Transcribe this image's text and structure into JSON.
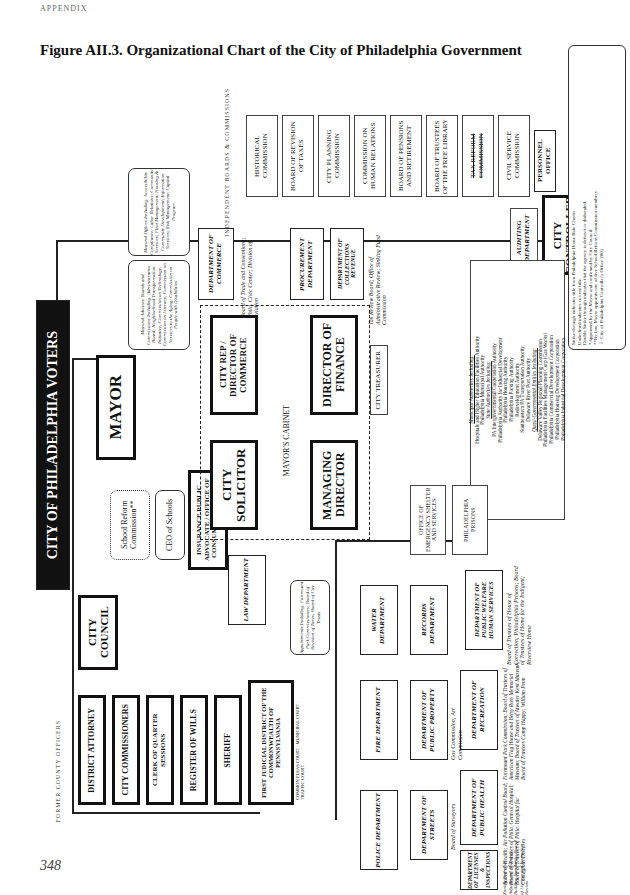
{
  "page": {
    "header": "APPENDIX",
    "title": "Figure AII.3.  Organizational Chart of the City of Philadelphia Government",
    "page_number": "348"
  },
  "chart": {
    "voters": "CITY OF PHILADELPHIA VOTERS",
    "mayor": "MAYOR",
    "city_council": "CITY COUNCIL",
    "city_controller": "CITY CONTROLLER",
    "auditing_department": "AUDITING DEPARTMENT",
    "school_reform": "School Reform Commission**",
    "ceo_schools": "CEO of Schools",
    "insurance_advocate": "INSURANCE PUBLIC ADVOCATE / OFFICE OF CONSUMER AFFAIRS*",
    "mayoral_advisory": "Mayoral Advisory Boards and Commissions Including: Administrative Board; Neighborhood Transformation Initiative; Commission on Technology; Commission on Literacy; Commission on Services to the Aging; Commission on People with Disabilities",
    "mayoral_offices": "Mayoral Offices Including: Accessibility Compliance; Labor Relations; Community Services; Fleet Management; Housing & Community Development; Information Services; Risk Management; Capital Program",
    "cabinet_label": "MAYOR'S CABINET",
    "city_solicitor": "CITY SOLICITOR",
    "city_rep": "CITY REP / DIRECTOR OF COMMERCE",
    "managing_director": "MANAGING DIRECTOR",
    "director_finance": "DIRECTOR OF FINANCE",
    "law_department": "LAW DEPARTMENT",
    "dept_commerce": "DEPARTMENT OF COMMERCE",
    "commerce_boards": "Board of Trade and Conventions; Phila. Civic Center; Division of Aviation",
    "procurement": "PROCUREMENT DEPARTMENT",
    "dept_revenue": "DEPARTMENT OF COLLECTIONS REVENUE",
    "finance_boards": "Tax Review Board; Office of Administrative Review; Sinking Fund Commission",
    "city_treasurer": "CITY TREASURER",
    "appointments": "Appointments Including: Fairmount Park Commissioners; Board of Revision of Taxes; Board of City Trusts",
    "independent_label": "INDEPENDENT BOARDS & COMMISSIONS",
    "independent_boards": [
      "HISTORICAL COMMISSION",
      "BOARD OF REVISION OF TAXES",
      "CITY PLANNING COMMISSION",
      "COMMISSION ON HUMAN RELATIONS",
      "BOARD OF PENSIONS AND RETIREMENT",
      "BOARD OF TRUSTEES OF THE FREE LIBRARY",
      "TAX REFORM COMMISSION",
      "CIVIL SERVICE COMMISSION",
      "PERSONNEL OFFICE"
    ],
    "authorities": {
      "municipal_heading": "Municipal Authorities Including:",
      "municipal": [
        "Hospitals and Higher Education Facilities Authority",
        "Philadelphia Municipal Authority"
      ],
      "state_heading": "State Authorities Including:",
      "state": [
        "PA Intergovernmental Cooperation Authority",
        "Philadelphia Authority for Industrial Development",
        "Philadelphia Housing Authority",
        "Philadelphia Parking Authority",
        "Redevelopment Authority",
        "Southeastern PA Transportation Authority",
        "Delaware River Port Authority"
      ],
      "quasi_heading": "Quasi-Governmental Entities Including:",
      "quasi": [
        "Delaware Valley Regional Planning Commission",
        "Philadelphia Facilities Management Corp (Gas Works)",
        "Philadelphia Commercial Development Corporation",
        "Philadelphia Housing Development Corporation",
        "Philadelphia Industrial Development Corporation"
      ]
    },
    "md_departments": [
      "OFFICE OF EMERGENCY SHELTER AND SERVICES",
      "PHILADELPHIA PRISONS",
      "DEPARTMENT OF PUBLIC WELFARE HUMAN SERVICES",
      "WATER DEPARTMENT",
      "RECORDS DEPARTMENT",
      "DEPARTMENT OF RECREATION",
      "FIRE DEPARTMENT",
      "DEPARTMENT OF PUBLIC PROPERTY",
      "DEPARTMENT OF PUBLIC HEALTH",
      "POLICE DEPARTMENT",
      "DEPARTMENT OF STREETS",
      "DEPARTMENT OF LICENSES & INSPECTIONS"
    ],
    "md_notes": {
      "human_services": "Board of Trustees of House of Correction; Philadelphia Prisons; Board of Trustees of Home for the Indigent; Riverview Home",
      "recreation": "Fairmount Park Commission; Board of Trustees of American Flag House and Betsy Ross Memorial Museum; Board of Trustees of Atwater Kent Museum; Board of Trustees Camp Happy; William Penn",
      "public_property": "Gas Commission; Art Commission",
      "public_health": "Board of Health; Air Pollution Control Board; Board of Trustees of Phila. General Hospital; Board of Trustees of Phila. Hospital for Contagious Diseases",
      "streets": "Board of Surveyors",
      "licenses": "Zoning Board of Adjustment; Board of Building Standards; Board of License and Inspection Review"
    },
    "former_label": "FORMER COUNTY OFFICERS",
    "former_county": [
      "DISTRICT ATTORNEY",
      "CITY COMMISSIONERS",
      "CLERK OF QUARTER SESSIONS",
      "REGISTER OF WILLS",
      "SHERIFF"
    ],
    "judicial": "FIRST JUDICIAL DISTRICT OF THE COMMONWEALTH OF PENNSYLVANIA",
    "judicial_courts": "COMMON PLEAS COURT · MUNICIPAL COURT · TRAFFIC COURT"
  },
  "legend": {
    "line1": "Strike-through indicates title from Philadelphia Home Rule Charter.",
    "line2": "Underlined indicates current title.",
    "line3": "Double Strike through indicates that the agency is defunct or disbanded.",
    "line4": "*Appointed by the Mayor and confirmed by City Council.",
    "line5": "**By law, Mayor appoints one of five School Reform Commission members",
    "line6": "© City of Philadelphia Controller's Office 2005"
  },
  "colors": {
    "ink": "#111111",
    "paper": "#ffffff"
  }
}
